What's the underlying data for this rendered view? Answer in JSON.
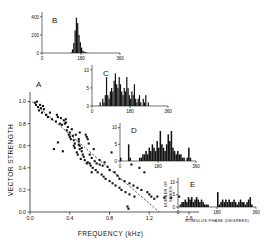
{
  "figure": {
    "panel_a_label": "A",
    "panel_b_label": "B",
    "panel_c_label": "C",
    "panel_d_label": "D",
    "panel_e_label": "E"
  },
  "chart_data": [
    {
      "type": "scatter",
      "panel": "A",
      "title": "A",
      "xlabel": "FREQUENCY   (kHz)",
      "ylabel": "VECTOR STRENGTH",
      "xlim": [
        0.0,
        1.7
      ],
      "ylim": [
        0.0,
        1.05
      ],
      "xticks": [
        0.0,
        0.4,
        0.8,
        1.2,
        1.6
      ],
      "xticklabels": [
        "0.0",
        "0.4",
        "0.8",
        "1.2",
        "1.6"
      ],
      "yticks": [
        0.0,
        0.2,
        0.4,
        0.6,
        0.8,
        1.0
      ],
      "yticklabels": [
        "0.0",
        "0.2",
        "0.4",
        "0.6",
        "0.8",
        "1.0"
      ],
      "grid": false,
      "legend": null,
      "regression_line": {
        "x": [
          0.02,
          1.3
        ],
        "y": [
          1.0,
          0.0
        ]
      },
      "points": [
        [
          0.05,
          0.99
        ],
        [
          0.06,
          0.97
        ],
        [
          0.07,
          1.0
        ],
        [
          0.08,
          0.95
        ],
        [
          0.09,
          0.92
        ],
        [
          0.1,
          0.97
        ],
        [
          0.11,
          0.94
        ],
        [
          0.12,
          0.9
        ],
        [
          0.13,
          0.96
        ],
        [
          0.14,
          0.93
        ],
        [
          0.16,
          0.88
        ],
        [
          0.18,
          0.86
        ],
        [
          0.2,
          0.9
        ],
        [
          0.22,
          0.84
        ],
        [
          0.24,
          0.57
        ],
        [
          0.26,
          0.82
        ],
        [
          0.27,
          0.88
        ],
        [
          0.28,
          0.63
        ],
        [
          0.3,
          0.8
        ],
        [
          0.31,
          0.85
        ],
        [
          0.32,
          0.79
        ],
        [
          0.33,
          0.55
        ],
        [
          0.34,
          0.83
        ],
        [
          0.35,
          0.8
        ],
        [
          0.36,
          0.81
        ],
        [
          0.37,
          0.74
        ],
        [
          0.38,
          0.77
        ],
        [
          0.39,
          0.7
        ],
        [
          0.4,
          0.72
        ],
        [
          0.4,
          0.68
        ],
        [
          0.41,
          0.66
        ],
        [
          0.42,
          0.75
        ],
        [
          0.43,
          0.69
        ],
        [
          0.44,
          0.65
        ],
        [
          0.45,
          0.58
        ],
        [
          0.45,
          0.62
        ],
        [
          0.46,
          0.7
        ],
        [
          0.47,
          0.54
        ],
        [
          0.48,
          0.52
        ],
        [
          0.49,
          0.61
        ],
        [
          0.5,
          0.6
        ],
        [
          0.5,
          0.57
        ],
        [
          0.51,
          0.48
        ],
        [
          0.52,
          0.55
        ],
        [
          0.53,
          0.52
        ],
        [
          0.54,
          0.5
        ],
        [
          0.55,
          0.47
        ],
        [
          0.56,
          0.7
        ],
        [
          0.57,
          0.68
        ],
        [
          0.58,
          0.66
        ],
        [
          0.58,
          0.45
        ],
        [
          0.59,
          0.62
        ],
        [
          0.6,
          0.44
        ],
        [
          0.61,
          0.42
        ],
        [
          0.62,
          0.49
        ],
        [
          0.63,
          0.4
        ],
        [
          0.64,
          0.57
        ],
        [
          0.65,
          0.46
        ],
        [
          0.66,
          0.38
        ],
        [
          0.67,
          0.44
        ],
        [
          0.68,
          0.36
        ],
        [
          0.7,
          0.43
        ],
        [
          0.7,
          0.47
        ],
        [
          0.72,
          0.34
        ],
        [
          0.73,
          0.42
        ],
        [
          0.74,
          0.32
        ],
        [
          0.75,
          0.45
        ],
        [
          0.76,
          0.3
        ],
        [
          0.78,
          0.41
        ],
        [
          0.8,
          0.28
        ],
        [
          0.8,
          0.38
        ],
        [
          0.82,
          0.54
        ],
        [
          0.83,
          0.26
        ],
        [
          0.85,
          0.36
        ],
        [
          0.86,
          0.24
        ],
        [
          0.88,
          0.33
        ],
        [
          0.9,
          0.22
        ],
        [
          0.9,
          0.3
        ],
        [
          0.92,
          0.2
        ],
        [
          0.95,
          0.28
        ],
        [
          0.96,
          0.18
        ],
        [
          0.98,
          0.05
        ],
        [
          0.99,
          0.03
        ],
        [
          1.0,
          0.26
        ],
        [
          1.0,
          0.16
        ],
        [
          1.02,
          0.43
        ],
        [
          1.04,
          0.24
        ],
        [
          1.05,
          0.14
        ],
        [
          1.08,
          0.22
        ],
        [
          1.1,
          0.4
        ],
        [
          1.12,
          0.2
        ],
        [
          1.15,
          0.36
        ],
        [
          1.18,
          0.18
        ],
        [
          1.2,
          0.16
        ],
        [
          1.22,
          0.14
        ],
        [
          1.25,
          0.12
        ],
        [
          1.28,
          0.14
        ],
        [
          1.35,
          0.13
        ],
        [
          1.42,
          0.13
        ],
        [
          1.5,
          0.14
        ],
        [
          0.28,
          0.86
        ],
        [
          0.36,
          0.84
        ],
        [
          0.44,
          0.6
        ],
        [
          0.52,
          0.58
        ],
        [
          0.6,
          0.52
        ],
        [
          0.49,
          0.66
        ],
        [
          0.49,
          0.64
        ],
        [
          0.5,
          0.72
        ],
        [
          0.57,
          0.44
        ],
        [
          0.62,
          0.36
        ]
      ]
    },
    {
      "type": "bar",
      "panel": "B",
      "title": "B",
      "xlabel": "",
      "ylabel": "",
      "xlim": [
        0,
        360
      ],
      "ylim": [
        0,
        420
      ],
      "xticks": [
        0,
        180,
        360
      ],
      "xticklabels": [
        "0",
        "180",
        "360"
      ],
      "yticks": [
        0,
        200,
        400
      ],
      "yticklabels": [
        "0",
        "200",
        "400"
      ],
      "bin_width_deg": 7.5,
      "bin_start_deg": 0,
      "values": [
        0,
        0,
        0,
        0,
        0,
        0,
        0,
        0,
        0,
        0,
        0,
        0,
        0,
        0,
        0,
        0,
        0,
        0,
        0,
        0,
        0,
        0,
        6,
        40,
        110,
        250,
        390,
        330,
        200,
        120,
        60,
        25,
        14,
        8,
        4,
        2,
        0,
        0,
        0,
        0,
        0,
        0,
        0,
        0,
        0,
        0,
        0,
        0,
        0,
        0,
        0,
        0,
        0,
        0,
        0,
        0,
        0,
        0,
        0,
        0
      ]
    },
    {
      "type": "bar",
      "panel": "C",
      "title": "C",
      "xlabel": "",
      "ylabel": "",
      "xlim": [
        0,
        360
      ],
      "ylim": [
        0,
        10.5
      ],
      "xticks": [
        0,
        180,
        360
      ],
      "xticklabels": [
        "0",
        "180",
        "360"
      ],
      "yticks": [
        0,
        5,
        10
      ],
      "yticklabels": [
        "0",
        "5",
        "10"
      ],
      "bin_width_deg": 7.5,
      "bin_start_deg": 0,
      "values": [
        0,
        0,
        0,
        0,
        0,
        0,
        1,
        0,
        2,
        1,
        3,
        8,
        3,
        2,
        4,
        5,
        4,
        7,
        9,
        6,
        5,
        8,
        6,
        4,
        3,
        5,
        4,
        8,
        5,
        3,
        2,
        4,
        3,
        6,
        2,
        1,
        2,
        3,
        1,
        0,
        2,
        1,
        3,
        0,
        1,
        0,
        0,
        0,
        0,
        0,
        0,
        0,
        0,
        0,
        0,
        0,
        0,
        0,
        0,
        0
      ]
    },
    {
      "type": "bar",
      "panel": "D",
      "title": "D",
      "xlabel": "",
      "ylabel": "",
      "xlim": [
        0,
        360
      ],
      "ylim": [
        0,
        10.5
      ],
      "xticks": [
        0,
        180,
        360
      ],
      "xticklabels": [
        "0",
        "180",
        "360"
      ],
      "yticks": [
        0,
        5,
        10
      ],
      "yticklabels": [
        "0",
        "5",
        "10"
      ],
      "bin_width_deg": 7.5,
      "bin_start_deg": 0,
      "values": [
        1,
        0,
        0,
        0,
        0,
        5,
        1,
        0,
        0,
        0,
        0,
        0,
        1,
        1,
        2,
        2,
        3,
        2,
        4,
        3,
        5,
        4,
        3,
        6,
        4,
        9,
        5,
        4,
        3,
        5,
        8,
        6,
        9,
        4,
        3,
        2,
        3,
        2,
        2,
        1,
        1,
        0,
        1,
        4,
        1,
        0,
        0,
        0
      ]
    },
    {
      "type": "bar",
      "panel": "E",
      "title": "E",
      "xlabel": "STIMULUS PHASE  (DEGREES)",
      "ylabel": "NUMBER OF SPIKES",
      "xlim": [
        0,
        360
      ],
      "ylim": [
        0,
        10.5
      ],
      "xticks": [
        0,
        180,
        360
      ],
      "xticklabels": [
        "0",
        "180",
        "360"
      ],
      "yticks": [
        0,
        5,
        10
      ],
      "yticklabels": [
        "0",
        "5",
        "10"
      ],
      "bin_width_deg": 7.5,
      "bin_start_deg": 0,
      "values": [
        0,
        1,
        2,
        2,
        3,
        2,
        4,
        3,
        4,
        2,
        3,
        4,
        3,
        2,
        3,
        2,
        1,
        1,
        1,
        0,
        0,
        0,
        0,
        0,
        6,
        1,
        2,
        3,
        2,
        3,
        2,
        3,
        2,
        2,
        3,
        2,
        1,
        2,
        3,
        2,
        2,
        1,
        2,
        3,
        4,
        1,
        0,
        0
      ]
    }
  ]
}
